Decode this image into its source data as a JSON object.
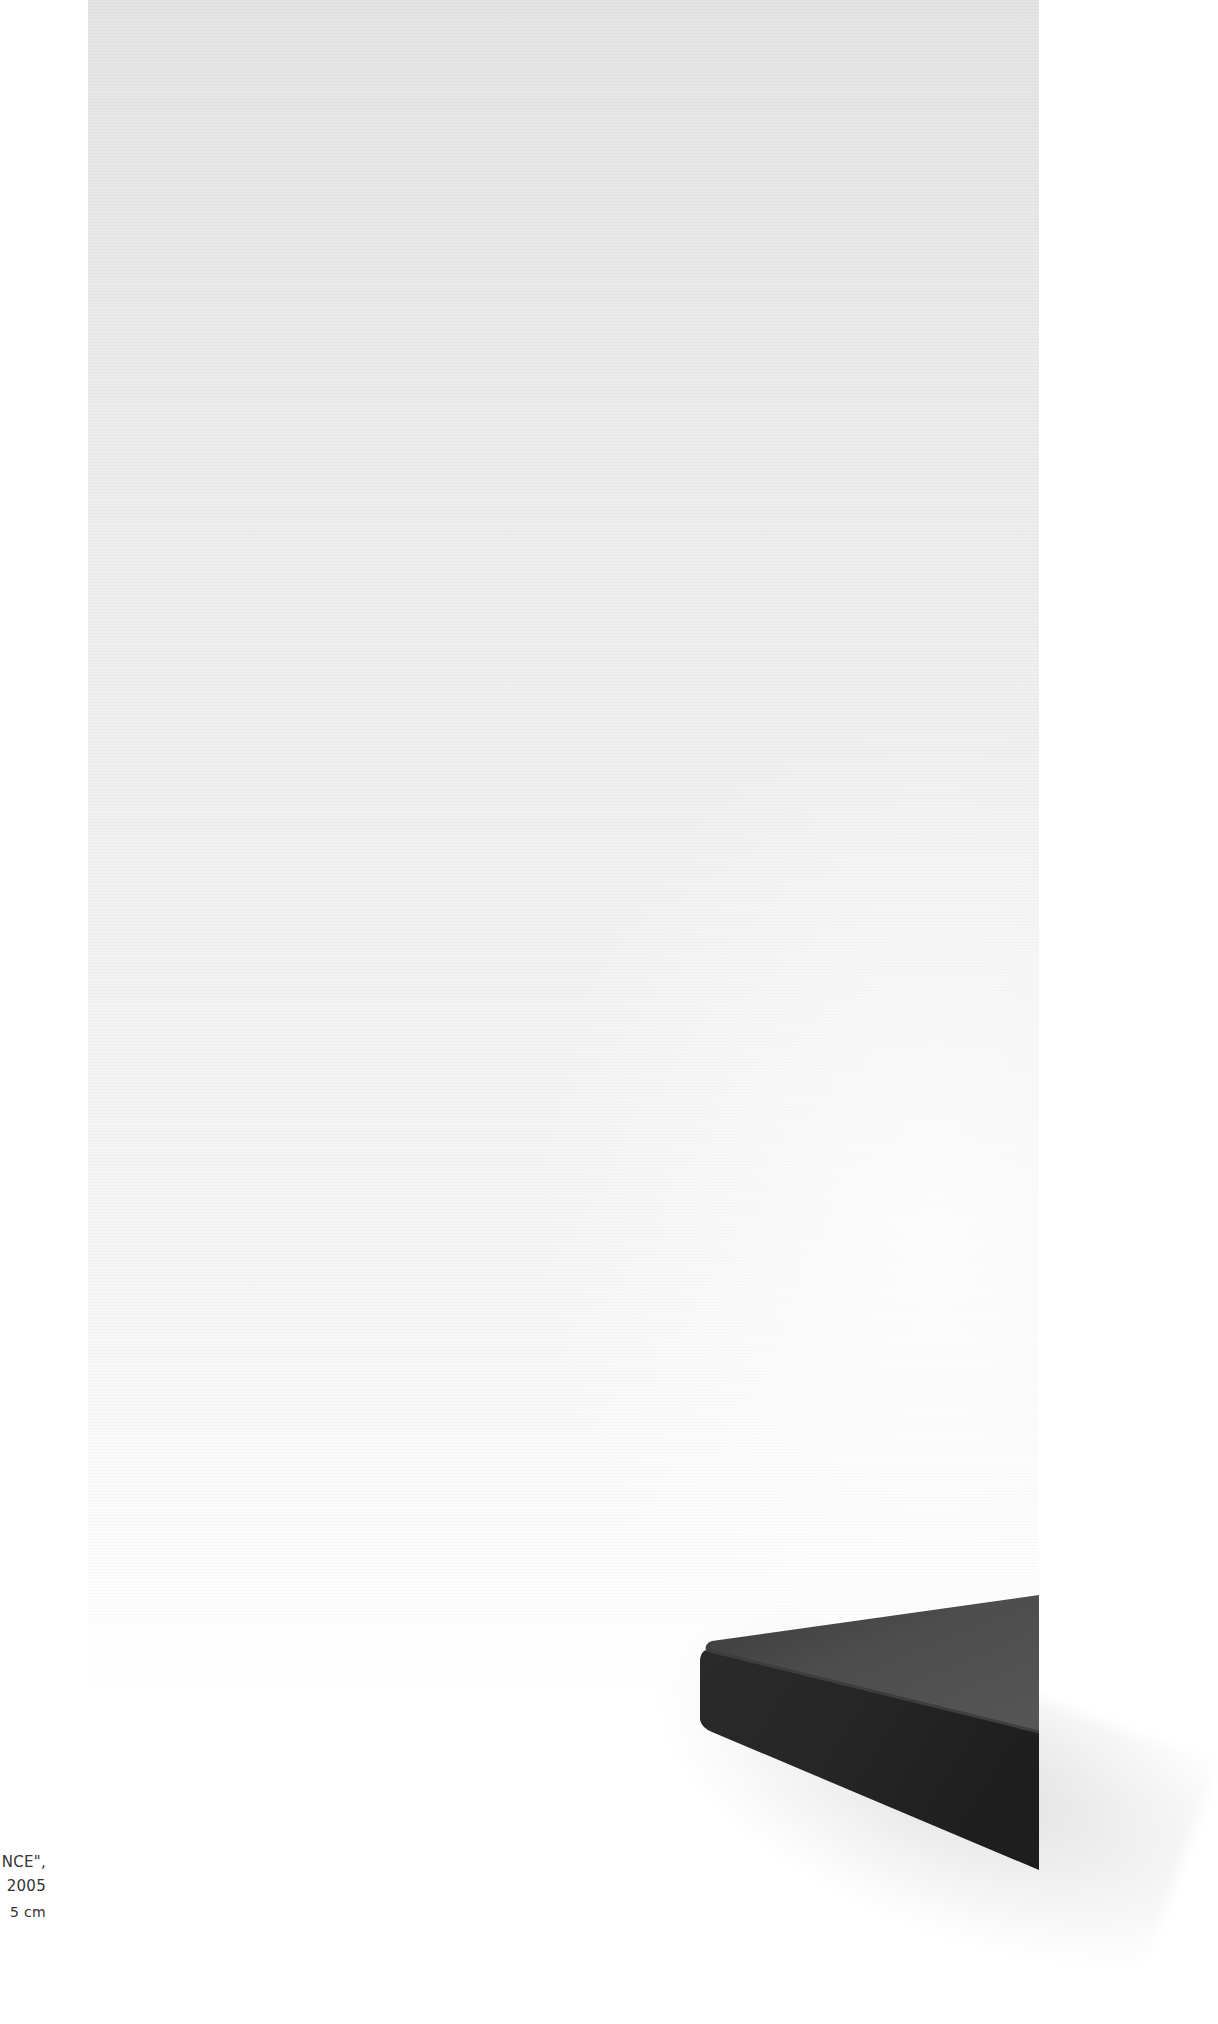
{
  "page": {
    "background_color": "#ffffff"
  },
  "photo": {
    "subject": "dark rectangular slab on white seamless backdrop",
    "backdrop_color": "#ececec",
    "slab_top_color": "#4a4a4a",
    "slab_side_color": "#2b2b2b"
  },
  "caption": {
    "title_fragment": "NCE\",",
    "year_fragment": "2005",
    "dimensions_fragment": "5 cm"
  }
}
